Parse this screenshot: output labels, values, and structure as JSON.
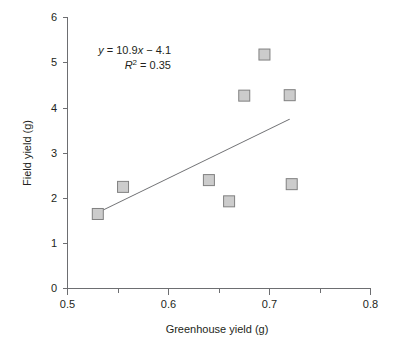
{
  "chart_data": {
    "type": "scatter",
    "title": "",
    "xlabel": "Greenhouse yield (g)",
    "ylabel": "Field yield (g)",
    "xlim": [
      0.5,
      0.8
    ],
    "ylim": [
      0,
      6
    ],
    "grid": false,
    "legend": null,
    "x_ticks_major": [
      "0.5",
      "0.6",
      "0.7",
      "0.8"
    ],
    "x_tick_values_major": [
      0.5,
      0.6,
      0.7,
      0.8
    ],
    "x_tick_values_minor": [
      0.55,
      0.65,
      0.75
    ],
    "y_ticks": [
      "0",
      "1",
      "2",
      "3",
      "4",
      "5",
      "6"
    ],
    "y_tick_values": [
      0,
      1,
      2,
      3,
      4,
      5,
      6
    ],
    "points": [
      {
        "x": 0.53,
        "y": 1.65
      },
      {
        "x": 0.555,
        "y": 2.25
      },
      {
        "x": 0.64,
        "y": 2.4
      },
      {
        "x": 0.66,
        "y": 1.93
      },
      {
        "x": 0.675,
        "y": 4.27
      },
      {
        "x": 0.695,
        "y": 5.18
      },
      {
        "x": 0.72,
        "y": 4.28
      },
      {
        "x": 0.722,
        "y": 2.31
      }
    ],
    "trendline": {
      "slope": 10.9,
      "intercept": -4.1,
      "x_start": 0.53,
      "x_end": 0.72,
      "y_start": 1.68,
      "y_end": 3.75
    },
    "annotations": {
      "equation_y": "y",
      "equation_body": " = 10.9",
      "equation_x": "x",
      "equation_tail": " − 4.1",
      "r2_symbol": "R",
      "r2_exponent": "2",
      "r2_value": " = 0.35"
    },
    "marker_style": {
      "shape": "square",
      "fill": "#cccccc",
      "edge": "#808080",
      "size_px": 11
    },
    "colors": {
      "axis": "#6d6e71",
      "text": "#231f20",
      "line": "#6d6e71",
      "background": "#ffffff"
    }
  }
}
